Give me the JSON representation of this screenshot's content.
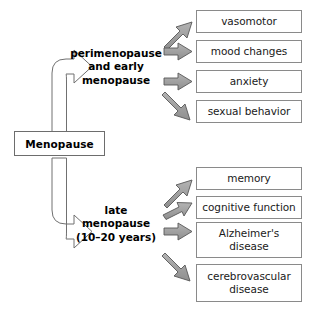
{
  "diagram": {
    "background_color": "#ffffff",
    "box_border_color": "#8a8a8a",
    "arrow_fill_color": "#9a9a9a",
    "arrow_outline_color": "#555555",
    "hollow_arrow_outline_color": "#707070",
    "text_color": "#1a1a1a"
  },
  "root": {
    "label": "Menopause"
  },
  "stages": [
    {
      "id": "early",
      "label": "perimenopause\nand early\nmenopause",
      "outcomes": [
        {
          "label": "vasomotor",
          "arrow": "up-right"
        },
        {
          "label": "mood changes",
          "arrow": "right"
        },
        {
          "label": "anxiety",
          "arrow": "right"
        },
        {
          "label": "sexual behavior",
          "arrow": "down-right"
        }
      ]
    },
    {
      "id": "late",
      "label": "late\nmenopause\n(10–20 years)",
      "outcomes": [
        {
          "label": "memory",
          "arrow": "up-right"
        },
        {
          "label": "cognitive function",
          "arrow": "up-right"
        },
        {
          "label": "Alzheimer's\ndisease",
          "arrow": "right"
        },
        {
          "label": "cerebrovascular\ndisease",
          "arrow": "down-right"
        }
      ]
    }
  ]
}
